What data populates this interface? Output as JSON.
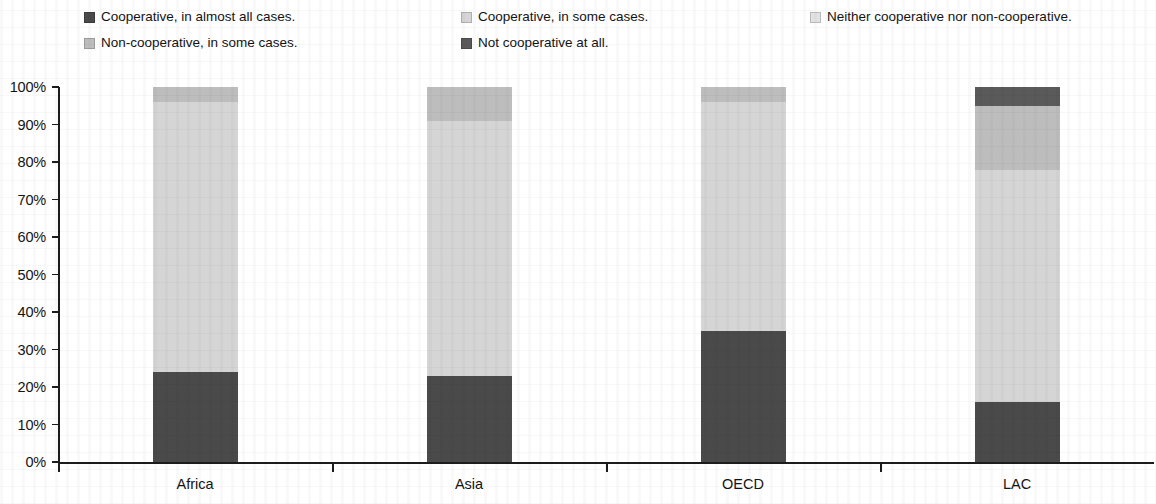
{
  "legend": {
    "items": [
      {
        "label": "Cooperative, in almost all cases.",
        "color": "#4a4a4a",
        "row": 0,
        "col": 0
      },
      {
        "label": "Cooperative, in some cases.",
        "color": "#d5d5d5",
        "row": 0,
        "col": 1
      },
      {
        "label": "Neither cooperative nor non-cooperative.",
        "color": "#e2e2e2",
        "row": 0,
        "col": 2
      },
      {
        "label": "Non-cooperative, in some cases.",
        "color": "#bdbdbd",
        "row": 1,
        "col": 0
      },
      {
        "label": "Not cooperative at all.",
        "color": "#5a5a5a",
        "row": 1,
        "col": 1
      }
    ]
  },
  "axis": {
    "y_ticks": [
      "100%",
      "90%",
      "80%",
      "70%",
      "60%",
      "50%",
      "40%",
      "30%",
      "20%",
      "10%",
      "0%"
    ],
    "x_categories": [
      "Africa",
      "Asia",
      "OECD",
      "LAC"
    ]
  },
  "chart_data": {
    "type": "bar",
    "title": "",
    "subtitle": "",
    "xlabel": "",
    "ylabel": "",
    "ylim": [
      0,
      100
    ],
    "y_tick_step": 10,
    "grid": false,
    "stacked": true,
    "stack_total": 100,
    "legend_position": "top",
    "categories": [
      "Africa",
      "Asia",
      "OECD",
      "LAC"
    ],
    "series": [
      {
        "name": "Cooperative, in almost all cases.",
        "color": "#4a4a4a",
        "values": [
          24,
          23,
          35,
          16
        ]
      },
      {
        "name": "Cooperative, in some cases.",
        "color": "#d5d5d5",
        "values": [
          72,
          68,
          61,
          62
        ]
      },
      {
        "name": "Neither cooperative nor non-cooperative.",
        "color": "#e2e2e2",
        "values": [
          0,
          0,
          0,
          0
        ]
      },
      {
        "name": "Non-cooperative, in some cases.",
        "color": "#bdbdbd",
        "values": [
          4,
          9,
          4,
          17
        ]
      },
      {
        "name": "Not cooperative at all.",
        "color": "#5a5a5a",
        "values": [
          0,
          0,
          0,
          5
        ]
      }
    ]
  }
}
